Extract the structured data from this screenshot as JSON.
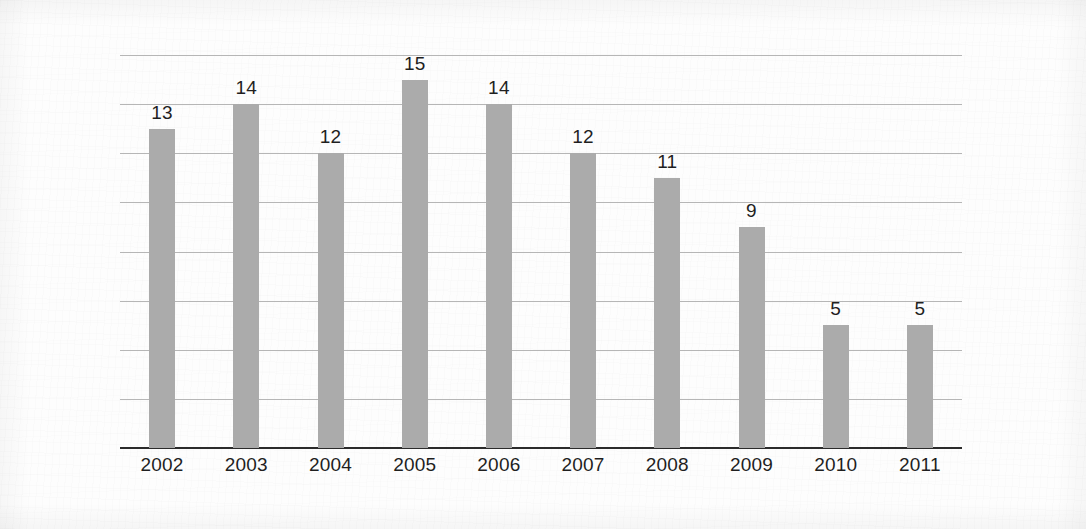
{
  "chart_data": {
    "type": "bar",
    "title": "",
    "subtitle": "",
    "xlabel": "",
    "ylabel": "",
    "categories": [
      "2002",
      "2003",
      "2004",
      "2005",
      "2006",
      "2007",
      "2008",
      "2009",
      "2010",
      "2011"
    ],
    "values": [
      13,
      14,
      12,
      15,
      14,
      12,
      11,
      9,
      5,
      5
    ],
    "data_labels": [
      "13",
      "14",
      "12",
      "15",
      "14",
      "12",
      "11",
      "9",
      "5",
      "5"
    ],
    "ylim": [
      0,
      16
    ],
    "y_gridline_values": [
      2,
      4,
      6,
      8,
      10,
      12,
      14,
      16
    ],
    "y_tick_labels_visible": false,
    "grid": true,
    "grid_orientation": "horizontal",
    "legend": null,
    "legend_position": "none",
    "annotations": [],
    "colors": {
      "bar": "#ababab",
      "gridline": "#b6b6b6",
      "axis": "#2b2b2b",
      "label_text": "#1f1f1f",
      "background": "#fdfdfd"
    }
  }
}
